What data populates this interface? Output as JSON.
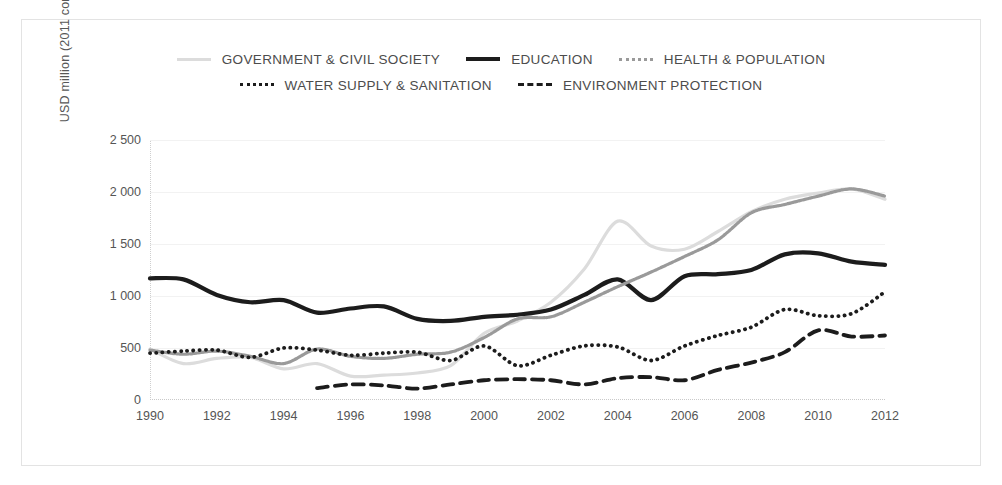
{
  "legend": {
    "rows": [
      [
        {
          "label": "GOVERNMENT & CIVIL SOCIETY",
          "key": "gov"
        },
        {
          "label": "EDUCATION",
          "key": "edu"
        },
        {
          "label": "HEALTH & POPULATION",
          "key": "hea"
        }
      ],
      [
        {
          "label": "WATER SUPPLY & SANITATION",
          "key": "wat"
        },
        {
          "label": "ENVIRONMENT PROTECTION",
          "key": "env"
        }
      ]
    ]
  },
  "axis": {
    "ylabel": "USD million (2011 constant prices)",
    "yticks": [
      "0",
      "500",
      "1 000",
      "1 500",
      "2 000",
      "2 500"
    ],
    "xticks": [
      "1990",
      "1992",
      "1994",
      "1996",
      "1998",
      "2000",
      "2002",
      "2004",
      "2006",
      "2008",
      "2010",
      "2012"
    ]
  },
  "colors": {
    "government": "#dcdcdc",
    "education": "#1c1c1c",
    "health": "#9a9a9a",
    "water": "#1c1c1c",
    "environment": "#1c1c1c",
    "grid": "#f2f2f2",
    "text": "#555555",
    "border": "#e3e3e3"
  },
  "chart_data": {
    "type": "line",
    "title": "",
    "xlabel": "",
    "ylabel": "USD million (2011 constant prices)",
    "xlim": [
      1990,
      2012
    ],
    "ylim": [
      0,
      2500
    ],
    "grid": true,
    "legend_position": "top-center",
    "x": [
      1990,
      1991,
      1992,
      1993,
      1994,
      1995,
      1996,
      1997,
      1998,
      1999,
      2000,
      2001,
      2002,
      2003,
      2004,
      2005,
      2006,
      2007,
      2008,
      2009,
      2010,
      2011,
      2012
    ],
    "series": [
      {
        "name": "GOVERNMENT & CIVIL SOCIETY",
        "values": [
          490,
          350,
          400,
          410,
          300,
          350,
          230,
          240,
          260,
          330,
          640,
          760,
          940,
          1260,
          1720,
          1480,
          1450,
          1620,
          1810,
          1930,
          1990,
          2030,
          1930
        ]
      },
      {
        "name": "EDUCATION",
        "values": [
          1170,
          1160,
          1010,
          940,
          960,
          840,
          880,
          900,
          780,
          760,
          800,
          820,
          870,
          1010,
          1160,
          960,
          1190,
          1210,
          1250,
          1400,
          1410,
          1330,
          1300
        ]
      },
      {
        "name": "HEALTH & POPULATION",
        "values": [
          480,
          440,
          470,
          420,
          350,
          490,
          420,
          400,
          440,
          460,
          600,
          780,
          800,
          940,
          1090,
          1230,
          1380,
          1540,
          1800,
          1880,
          1960,
          2030,
          1960
        ]
      },
      {
        "name": "WATER SUPPLY & SANITATION",
        "values": [
          450,
          470,
          480,
          410,
          500,
          480,
          430,
          450,
          460,
          380,
          520,
          330,
          430,
          520,
          510,
          380,
          520,
          620,
          700,
          870,
          810,
          830,
          1040
        ]
      },
      {
        "name": "ENVIRONMENT PROTECTION",
        "values": [
          null,
          null,
          null,
          null,
          null,
          115,
          150,
          140,
          110,
          150,
          190,
          200,
          190,
          150,
          210,
          220,
          190,
          290,
          360,
          460,
          670,
          610,
          620
        ]
      }
    ]
  }
}
